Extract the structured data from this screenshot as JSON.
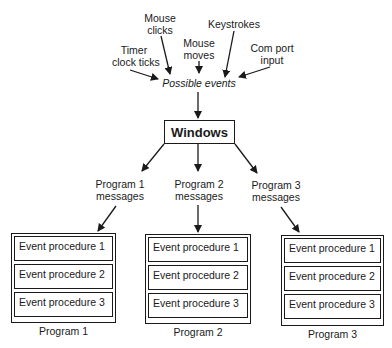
{
  "sources": [
    {
      "id": "timer",
      "label": "Timer\nclock ticks"
    },
    {
      "id": "mouse-clicks",
      "label": "Mouse\nclicks"
    },
    {
      "id": "mouse-moves",
      "label": "Mouse\nmoves"
    },
    {
      "id": "keystrokes",
      "label": "Keystrokes"
    },
    {
      "id": "com-port",
      "label": "Com port\ninput"
    }
  ],
  "events_label": "Possible events",
  "windows_label": "Windows",
  "messages": [
    {
      "label": "Program 1\nmessages"
    },
    {
      "label": "Program 2\nmessages"
    },
    {
      "label": "Program 3\nmessages"
    }
  ],
  "programs": [
    {
      "name": "Program 1",
      "procedures": [
        "Event procedure 1",
        "Event procedure 2",
        "Event procedure 3"
      ]
    },
    {
      "name": "Program 2",
      "procedures": [
        "Event procedure 1",
        "Event procedure 2",
        "Event procedure 3"
      ]
    },
    {
      "name": "Program 3",
      "procedures": [
        "Event procedure 1",
        "Event procedure 2",
        "Event procedure 3"
      ]
    }
  ]
}
